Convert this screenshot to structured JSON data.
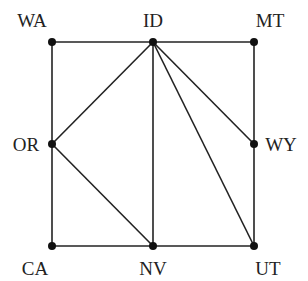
{
  "chart_data": {
    "type": "graph",
    "title": "",
    "nodes": [
      {
        "id": "WA",
        "label": "WA",
        "x": 52,
        "y": 42,
        "lx": 32,
        "ly": 27
      },
      {
        "id": "ID",
        "label": "ID",
        "x": 153,
        "y": 42,
        "lx": 153,
        "ly": 27
      },
      {
        "id": "MT",
        "label": "MT",
        "x": 254,
        "y": 42,
        "lx": 270,
        "ly": 27
      },
      {
        "id": "OR",
        "label": "OR",
        "x": 52,
        "y": 144,
        "lx": 26,
        "ly": 151
      },
      {
        "id": "WY",
        "label": "WY",
        "x": 254,
        "y": 144,
        "lx": 281,
        "ly": 151
      },
      {
        "id": "CA",
        "label": "CA",
        "x": 52,
        "y": 246,
        "lx": 35,
        "ly": 275
      },
      {
        "id": "NV",
        "label": "NV",
        "x": 153,
        "y": 246,
        "lx": 153,
        "ly": 275
      },
      {
        "id": "UT",
        "label": "UT",
        "x": 254,
        "y": 246,
        "lx": 268,
        "ly": 275
      }
    ],
    "edges": [
      [
        "WA",
        "ID"
      ],
      [
        "ID",
        "MT"
      ],
      [
        "WA",
        "OR"
      ],
      [
        "OR",
        "CA"
      ],
      [
        "MT",
        "WY"
      ],
      [
        "WY",
        "UT"
      ],
      [
        "CA",
        "NV"
      ],
      [
        "NV",
        "UT"
      ],
      [
        "ID",
        "OR"
      ],
      [
        "ID",
        "NV"
      ],
      [
        "ID",
        "UT"
      ],
      [
        "ID",
        "WY"
      ],
      [
        "OR",
        "NV"
      ]
    ]
  }
}
